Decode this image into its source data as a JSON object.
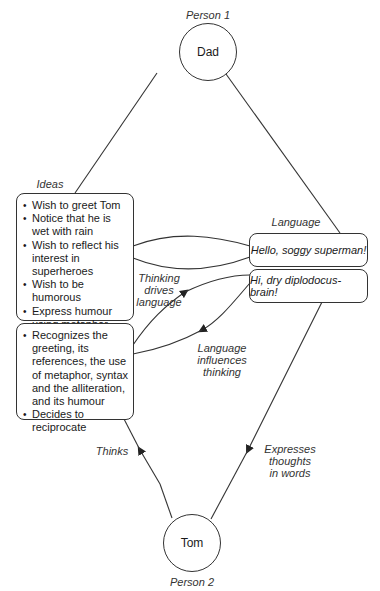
{
  "person1": {
    "caption": "Person 1",
    "name": "Dad"
  },
  "person2": {
    "caption": "Person 2",
    "name": "Tom"
  },
  "labels": {
    "ideas": "Ideas",
    "language": "Language",
    "thinking_drives": [
      "Thinking",
      "drives",
      "language"
    ],
    "language_influences": [
      "Language",
      "influences",
      "thinking"
    ],
    "thinks": "Thinks",
    "expresses": [
      "Expresses",
      "thoughts",
      "in words"
    ]
  },
  "ideas_box": {
    "items": [
      "Wish to greet Tom",
      "Notice that he is wet with rain",
      "Wish to reflect his interest in superheroes",
      "Wish to be humorous",
      "Express humour using metaphor and alliteration"
    ]
  },
  "response_box": {
    "items": [
      "Recognizes the greeting, its references, the use of metaphor, syntax and the alliteration, and its humour",
      "Decides to reciprocate"
    ]
  },
  "utterances": {
    "dad": "Hello, soggy superman!",
    "tom": "Hi, dry diplodocus-brain!"
  },
  "colors": {
    "stroke": "#333333",
    "text": "#1a1a1a"
  }
}
